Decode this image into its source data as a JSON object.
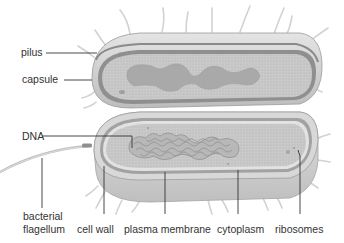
{
  "diagram": {
    "labels": {
      "pilus": "pilus",
      "capsule": "capsule",
      "dna": "DNA",
      "flagellum_line1": "bacterial",
      "flagellum_line2": "flagellum",
      "cell_wall": "cell wall",
      "plasma_membrane": "plasma membrane",
      "cytoplasm": "cytoplasm",
      "ribosomes": "ribosomes"
    },
    "colors": {
      "capsule_fill": "#d4d4d4",
      "cell_wall": "#8e8e8e",
      "cytoplasm_fill": "#c6c6c6",
      "dna_fill": "#a8a8a8",
      "leader_line": "#333333",
      "pili": "#cfcfcf",
      "text": "#333333"
    }
  }
}
